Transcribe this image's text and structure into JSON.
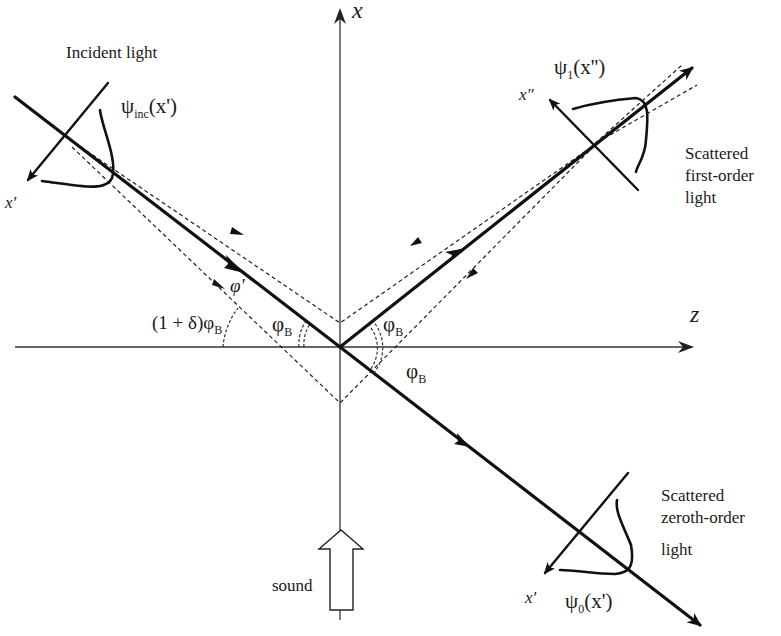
{
  "diagram": {
    "axes": {
      "x_label": "x",
      "z_label": "z"
    },
    "labels": {
      "incident": "Incident light",
      "psi_inc": "ψ",
      "psi_inc_sub": "inc",
      "psi_inc_arg": "(x')",
      "x_prime_incident": "x'",
      "psi_1": "ψ",
      "psi_1_sub": "1",
      "psi_1_arg": "(x'')",
      "x_double_prime": "x\"",
      "first_order_line1": "Scattered",
      "first_order_line2": "first-order",
      "first_order_line3": "light",
      "zeroth_order_line1": "Scattered",
      "zeroth_order_line2": "zeroth-order",
      "zeroth_order_line3": "light",
      "psi_0": "ψ",
      "psi_0_sub": "0",
      "psi_0_arg": "(x')",
      "x_prime_zeroth": "x'",
      "phi_prime": "φ'",
      "one_plus_delta": "(1 + δ)φ",
      "one_plus_delta_sub": "B",
      "phi_B_symbol": "φ",
      "phi_B_sub": "B",
      "sound": "sound"
    },
    "angles": [
      {
        "name": "incident-bragg-angle",
        "symbol": "φB"
      },
      {
        "name": "first-order-bragg-angle",
        "symbol": "φB"
      },
      {
        "name": "zeroth-order-bragg-angle",
        "symbol": "φB"
      },
      {
        "name": "off-bragg-angle",
        "symbol": "(1+δ)φB"
      },
      {
        "name": "phi-prime",
        "symbol": "φ'"
      }
    ]
  }
}
